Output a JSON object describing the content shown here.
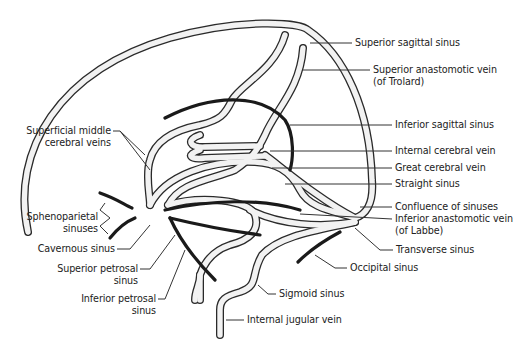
{
  "diagram": {
    "labels": [
      {
        "id": "superior_sagittal_sinus",
        "text": "Superior sagittal sinus",
        "x": 355,
        "y": 37
      },
      {
        "id": "superior_anastomotic_vein_1",
        "text": "Superior anastomotic vein",
        "x": 373,
        "y": 66
      },
      {
        "id": "superior_anastomotic_vein_2",
        "text": "(of Trolard)",
        "x": 373,
        "y": 78
      },
      {
        "id": "inferior_sagittal_sinus",
        "text": "Inferior sagittal sinus",
        "x": 395,
        "y": 120
      },
      {
        "id": "internal_cerebral_vein",
        "text": "Internal cerebral vein",
        "x": 395,
        "y": 146
      },
      {
        "id": "great_cerebral_vein",
        "text": "Great cerebral vein",
        "x": 395,
        "y": 163
      },
      {
        "id": "straight_sinus",
        "text": "Straight sinus",
        "x": 395,
        "y": 179
      },
      {
        "id": "confluence_of_sinuses",
        "text": "Confluence of sinuses",
        "x": 395,
        "y": 202
      },
      {
        "id": "inferior_anastomotic_vein_1",
        "text": "Inferior anastomotic vein",
        "x": 395,
        "y": 215
      },
      {
        "id": "inferior_anastomotic_vein_2",
        "text": "(of Labbe)",
        "x": 395,
        "y": 227
      },
      {
        "id": "transverse_sinus",
        "text": "Transverse sinus",
        "x": 396,
        "y": 246
      },
      {
        "id": "occipital_sinus",
        "text": "Occipital sinus",
        "x": 350,
        "y": 264
      },
      {
        "id": "sigmoid_sinus",
        "text": "Sigmoid sinus",
        "x": 279,
        "y": 290
      },
      {
        "id": "internal_jugular_vein",
        "text": "Internal jugular vein",
        "x": 247,
        "y": 316
      },
      {
        "id": "superficial_middle_cerebral_veins_1",
        "text": "Superficial middle",
        "x": 27,
        "y": 127,
        "align": "right",
        "w": 84
      },
      {
        "id": "superficial_middle_cerebral_veins_2",
        "text": "cerebral veins",
        "x": 27,
        "y": 139,
        "align": "right",
        "w": 84
      },
      {
        "id": "sphenoparietal_sinuses_1",
        "text": "Sphenoparietal",
        "x": 10,
        "y": 211,
        "align": "right",
        "w": 81
      },
      {
        "id": "sphenoparietal_sinuses_2",
        "text": "sinuses",
        "x": 10,
        "y": 223,
        "align": "right",
        "w": 81
      },
      {
        "id": "cavernous_sinus",
        "text": "Cavernous sinus",
        "x": 20,
        "y": 243,
        "align": "right",
        "w": 95
      },
      {
        "id": "superior_petrosal_sinus_1",
        "text": "Superior petrosal",
        "x": 40,
        "y": 263,
        "align": "right",
        "w": 98
      },
      {
        "id": "superior_petrosal_sinus_2",
        "text": "sinus",
        "x": 40,
        "y": 275,
        "align": "right",
        "w": 98
      },
      {
        "id": "inferior_petrosal_sinus_1",
        "text": "Inferior petrosal",
        "x": 60,
        "y": 293,
        "align": "right",
        "w": 96
      },
      {
        "id": "inferior_petrosal_sinus_2",
        "text": "sinus",
        "x": 60,
        "y": 305,
        "align": "right",
        "w": 96
      }
    ]
  }
}
